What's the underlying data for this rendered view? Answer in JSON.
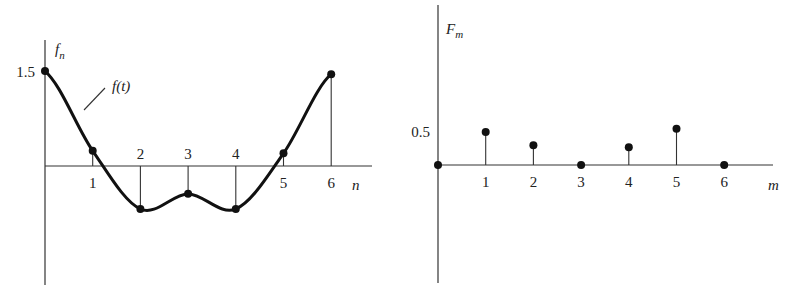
{
  "chart_data": [
    {
      "type": "line",
      "title": "",
      "ylabel": "f",
      "ylabel_subscript": "n",
      "xlabel": "n",
      "curve_label": "f(t)",
      "x": [
        0,
        1,
        2,
        3,
        4,
        5,
        6
      ],
      "x_tick_labels": [
        "1",
        "2",
        "3",
        "4",
        "5",
        "6"
      ],
      "y_tick_labels": [
        "1.5"
      ],
      "y_ticks": [
        1.5
      ],
      "series": [
        {
          "name": "f_n (samples)",
          "values": [
            1.5,
            0.24,
            -0.68,
            -0.44,
            -0.68,
            0.2,
            1.45
          ]
        }
      ],
      "ylim": [
        -1.9,
        2.0
      ],
      "xlim": [
        0,
        6.8
      ],
      "grid": false,
      "legend": "none"
    },
    {
      "type": "bar",
      "subtype": "stem",
      "title": "",
      "ylabel": "F",
      "ylabel_subscript": "m",
      "xlabel": "m",
      "categories": [
        0,
        1,
        2,
        3,
        4,
        5,
        6
      ],
      "x_tick_labels": [
        "1",
        "2",
        "3",
        "4",
        "5",
        "6"
      ],
      "y_tick_labels": [
        "0.5"
      ],
      "y_ticks": [
        0.5
      ],
      "values": [
        0,
        0.5,
        0.3,
        0,
        0.27,
        0.55,
        0
      ],
      "ylim": [
        -1.8,
        2.4
      ],
      "xlim": [
        0,
        7
      ],
      "grid": false,
      "legend": "none"
    }
  ]
}
